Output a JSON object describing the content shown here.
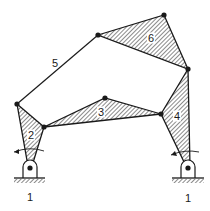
{
  "diagram": {
    "type": "planar linkage mechanism (six-bar)",
    "colors": {
      "line": "#1a1a1a",
      "hatch": "#2a2a2a",
      "background": "#ffffff"
    },
    "joints": {
      "A": [
        17,
        104
      ],
      "B": [
        44,
        127
      ],
      "C": [
        105,
        98
      ],
      "D": [
        161,
        114
      ],
      "E": [
        188,
        69
      ],
      "F": [
        98,
        35
      ],
      "G": [
        164,
        15
      ],
      "O_left": [
        30,
        168
      ],
      "O_right": [
        188,
        168
      ]
    },
    "links": [
      {
        "id": "1",
        "label": "1",
        "kind": "ground",
        "note": "left fixed pivot"
      },
      {
        "id": "1b",
        "label": "1",
        "kind": "ground",
        "note": "right fixed pivot"
      },
      {
        "id": "2",
        "label": "2",
        "kind": "ternary",
        "joints": [
          "A",
          "B",
          "O_left"
        ]
      },
      {
        "id": "3",
        "label": "3",
        "kind": "ternary",
        "joints": [
          "B",
          "C",
          "D"
        ]
      },
      {
        "id": "4",
        "label": "4",
        "kind": "ternary",
        "joints": [
          "D",
          "E",
          "O_right"
        ]
      },
      {
        "id": "5",
        "label": "5",
        "kind": "binary",
        "joints": [
          "A",
          "F"
        ]
      },
      {
        "id": "6",
        "label": "6",
        "kind": "ternary",
        "joints": [
          "F",
          "G",
          "E"
        ]
      }
    ],
    "labels": {
      "link1_left": "1",
      "link1_right": "1",
      "link2": "2",
      "link3": "3",
      "link4": "4",
      "link5": "5",
      "link6": "6"
    },
    "annotations": [
      "rotation arrow at left pivot",
      "rotation arrow at right pivot"
    ]
  }
}
